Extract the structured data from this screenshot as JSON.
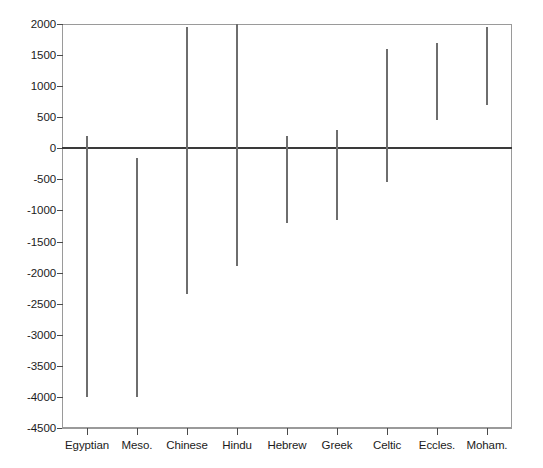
{
  "chart_data": {
    "type": "bar",
    "title": "",
    "subtitle": "",
    "xlabel": "",
    "ylabel": "",
    "grid": false,
    "legend": null,
    "ylim": [
      -4500,
      2000
    ],
    "ytick_step": 500,
    "yticks": [
      2000,
      1500,
      1000,
      500,
      0,
      -500,
      -1000,
      -1500,
      -2000,
      -2500,
      -3000,
      -3500,
      -4000,
      -4500
    ],
    "ytick_labels": [
      "2000",
      "1500",
      "1000",
      "500",
      "0",
      "-500",
      "-1000",
      "-1500",
      "-2000",
      "-2500",
      "-3000",
      "-3500",
      "-4000",
      "-4500"
    ],
    "categories": [
      "Egyptian",
      "Meso.",
      "Chinese",
      "Hindu",
      "Hebrew",
      "Greek",
      "Celtic",
      "Eccles.",
      "Moham."
    ],
    "series": [
      {
        "name": "range",
        "encoding": "vertical-range-line",
        "starts": [
          200,
          -150,
          1950,
          2000,
          200,
          300,
          1600,
          1700,
          1950
        ],
        "ends": [
          -4000,
          -4000,
          -2350,
          -1900,
          -1200,
          -1150,
          -550,
          450,
          700
        ]
      }
    ],
    "bars": [
      {
        "category": "Egyptian",
        "top": 200,
        "bottom": -4000
      },
      {
        "category": "Meso.",
        "top": -150,
        "bottom": -4000
      },
      {
        "category": "Chinese",
        "top": 1950,
        "bottom": -2350
      },
      {
        "category": "Hindu",
        "top": 2000,
        "bottom": -1900
      },
      {
        "category": "Hebrew",
        "top": 200,
        "bottom": -1200
      },
      {
        "category": "Greek",
        "top": 300,
        "bottom": -1150
      },
      {
        "category": "Celtic",
        "top": 1600,
        "bottom": -550
      },
      {
        "category": "Eccles.",
        "top": 1700,
        "bottom": 450
      },
      {
        "category": "Moham.",
        "top": 1950,
        "bottom": 700
      }
    ],
    "zero_reference_line": 0,
    "colors": {
      "background": "#ffffff",
      "frame": "#9a9a9a",
      "bar": "#6e6e6e",
      "zero_line": "#3a3a3a",
      "text": "#1b1b1b"
    }
  }
}
